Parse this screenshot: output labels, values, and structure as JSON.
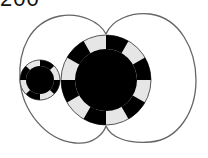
{
  "label": "200",
  "colors": {
    "stroke": "#666666",
    "dark": "#000000",
    "light": "#e6e6e6",
    "bg": "#ffffff"
  },
  "diagram": {
    "outline": "two-lobe curve enclosing both rings, lobes meet above and below the large ring",
    "rings": [
      {
        "name": "small-ring",
        "cx": 40,
        "cy": 80,
        "r_outer": 20,
        "r_inner": 14,
        "segments": 8
      },
      {
        "name": "large-ring",
        "cx": 106,
        "cy": 80,
        "r_outer": 45,
        "r_inner": 31,
        "segments": 12
      }
    ]
  }
}
